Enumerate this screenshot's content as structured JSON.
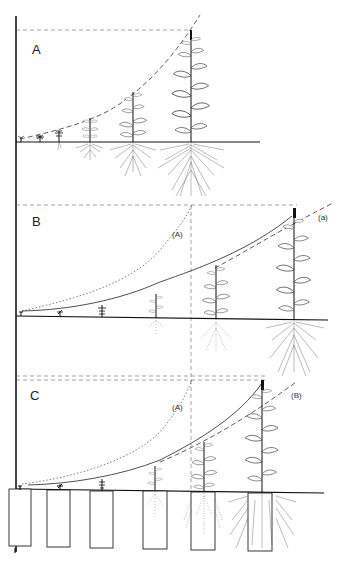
{
  "figure": {
    "panels": [
      {
        "id": "A",
        "label": "A",
        "curve_style": "dashed",
        "curve_labels": [],
        "plant_count": 6,
        "pots": false
      },
      {
        "id": "B",
        "label": "B",
        "curve_style": "solid",
        "curve_labels": [
          "(A)",
          "(a)"
        ],
        "plant_count": 6,
        "pots": false
      },
      {
        "id": "C",
        "label": "C",
        "curve_style": "solid",
        "curve_labels": [
          "(A)",
          "(B)"
        ],
        "plant_count": 6,
        "pots": true
      }
    ]
  },
  "labels": {
    "panel_a": "A",
    "panel_b": "B",
    "panel_c": "C",
    "b_ref_a": "(A)",
    "b_ref_lower": "(a)",
    "c_ref_a": "(A)",
    "c_ref_b": "(B)"
  }
}
